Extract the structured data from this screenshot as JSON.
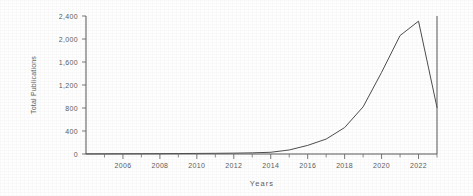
{
  "chart_data": {
    "type": "line",
    "title": "",
    "xlabel": "Years",
    "ylabel": "Total Publications",
    "xlim": [
      2004,
      2023
    ],
    "ylim": [
      0,
      2400
    ],
    "grid": false,
    "legend": null,
    "y_ticks": [
      0,
      400,
      800,
      1200,
      1600,
      2000,
      2400
    ],
    "y_tick_labels": [
      "0",
      "400",
      "800",
      "1,200",
      "1,600",
      "2,000",
      "2,400"
    ],
    "x_ticks": [
      2006,
      2008,
      2010,
      2012,
      2014,
      2016,
      2018,
      2020,
      2022
    ],
    "x_tick_labels": [
      "2006",
      "2008",
      "2010",
      "2012",
      "2014",
      "2016",
      "2018",
      "2020",
      "2022"
    ],
    "x_minor_ticks": [
      2005,
      2007,
      2009,
      2011,
      2013,
      2015,
      2017,
      2019,
      2021,
      2023
    ],
    "series": [
      {
        "name": "Total Publications",
        "color": "#4b4b4b",
        "x": [
          2004,
          2005,
          2006,
          2007,
          2008,
          2009,
          2010,
          2011,
          2012,
          2013,
          2014,
          2015,
          2016,
          2017,
          2018,
          2019,
          2020,
          2021,
          2022,
          2023
        ],
        "values": [
          2,
          3,
          4,
          5,
          6,
          8,
          10,
          12,
          15,
          20,
          30,
          70,
          150,
          260,
          460,
          820,
          1420,
          2060,
          2310,
          810
        ]
      }
    ]
  },
  "axes": {
    "x_title": "Years",
    "y_title": "Total Publications"
  }
}
